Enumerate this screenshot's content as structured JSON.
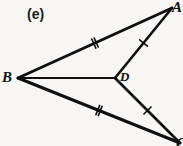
{
  "figure": {
    "part_label": "(e)",
    "background_color": "#f7f6f4",
    "stroke_color": "#101010",
    "width": 183,
    "height": 146,
    "vertices": [
      {
        "id": "B",
        "label": "B",
        "x": 18,
        "y": 78
      },
      {
        "id": "A",
        "label": "A",
        "x": 172,
        "y": 8
      },
      {
        "id": "D",
        "label": "D",
        "x": 115,
        "y": 78
      },
      {
        "id": "C",
        "label": "C",
        "x": 180,
        "y": 143
      }
    ],
    "segments": [
      {
        "id": "BA",
        "from": "B",
        "to": "A",
        "tick_marks": 2,
        "stroke_width": 3.0
      },
      {
        "id": "BC",
        "from": "B",
        "to": "C",
        "tick_marks": 2,
        "stroke_width": 3.0
      },
      {
        "id": "DA",
        "from": "D",
        "to": "A",
        "tick_marks": 1,
        "stroke_width": 2.6
      },
      {
        "id": "DC",
        "from": "D",
        "to": "C",
        "tick_marks": 1,
        "stroke_width": 2.6
      },
      {
        "id": "BD",
        "from": "B",
        "to": "D",
        "tick_marks": 0,
        "stroke_width": 1.8
      }
    ],
    "congruence_notes": {
      "double_tick_pair": "BA = BC",
      "single_tick_pair": "DA = DC"
    }
  }
}
